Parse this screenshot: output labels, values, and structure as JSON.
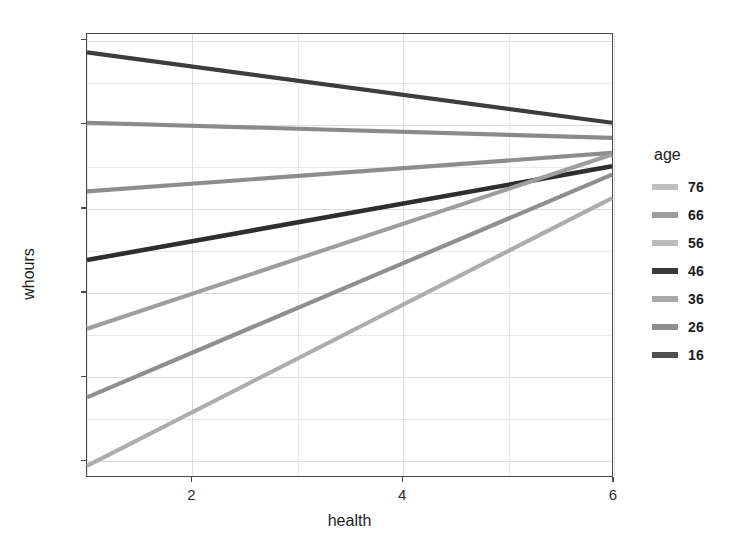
{
  "chart_data": {
    "type": "line",
    "title": "",
    "xlabel": "health",
    "ylabel": "whours",
    "xlim": [
      1,
      6
    ],
    "ylim": [
      -6.0,
      20.4
    ],
    "xticks": [
      2,
      4,
      6
    ],
    "yticks": [
      -5,
      0,
      5,
      10,
      15,
      20
    ],
    "xtick_labels": [
      "2",
      "4",
      "6"
    ],
    "ytick_labels": [
      "-5",
      "0",
      "5",
      "10",
      "15",
      "20"
    ],
    "grid": true,
    "legend_position": "right",
    "legend_title": "age",
    "x": [
      1,
      6
    ],
    "series": [
      {
        "name": "76",
        "values": [
          15.1,
          14.2
        ],
        "color": "#b5b5b5"
      },
      {
        "name": "66",
        "values": [
          11.0,
          13.3
        ],
        "color": "#9a9a9a"
      },
      {
        "name": "56",
        "values": [
          19.3,
          15.1
        ],
        "color": "#bdbdbd"
      },
      {
        "name": "46",
        "values": [
          6.9,
          12.5
        ],
        "color": "#2e2e2e"
      },
      {
        "name": "36",
        "values": [
          2.8,
          13.2
        ],
        "color": "#8d8d8d"
      },
      {
        "name": "26",
        "values": [
          -1.3,
          12.0
        ],
        "color": "#8a8a8a"
      },
      {
        "name": "16",
        "values": [
          -5.4,
          10.6
        ],
        "color": "#3d3d3d"
      }
    ],
    "plotted_order": [
      {
        "name": "16",
        "y0": 19.3,
        "y1": 15.1,
        "color": "#3d3d3d",
        "width": 4.2
      },
      {
        "name": "26",
        "y0": 15.1,
        "y1": 14.2,
        "color": "#8a8a8a",
        "width": 4.2
      },
      {
        "name": "36",
        "y0": 11.0,
        "y1": 13.3,
        "color": "#8d8d8d",
        "width": 4.2
      },
      {
        "name": "46",
        "y0": 6.9,
        "y1": 12.5,
        "color": "#2e2e2e",
        "width": 4.6
      },
      {
        "name": "56",
        "y0": 2.8,
        "y1": 13.2,
        "color": "#9e9e9e",
        "width": 4.2
      },
      {
        "name": "66",
        "y0": -1.3,
        "y1": 12.0,
        "color": "#8f8f8f",
        "width": 4.2
      },
      {
        "name": "76",
        "y0": -5.4,
        "y1": 10.6,
        "color": "#adadad",
        "width": 4.2
      }
    ]
  },
  "legend": {
    "title": "age",
    "items": [
      {
        "label": "76",
        "color": "#c0c0c0"
      },
      {
        "label": "66",
        "color": "#9d9d9d"
      },
      {
        "label": "56",
        "color": "#bbbbbb"
      },
      {
        "label": "46",
        "color": "#3a3a3a"
      },
      {
        "label": "36",
        "color": "#a9a9a9"
      },
      {
        "label": "26",
        "color": "#8f8f8f"
      },
      {
        "label": "16",
        "color": "#4f4f4f"
      }
    ]
  },
  "axes": {
    "y_label": "whours",
    "x_label": "health"
  }
}
